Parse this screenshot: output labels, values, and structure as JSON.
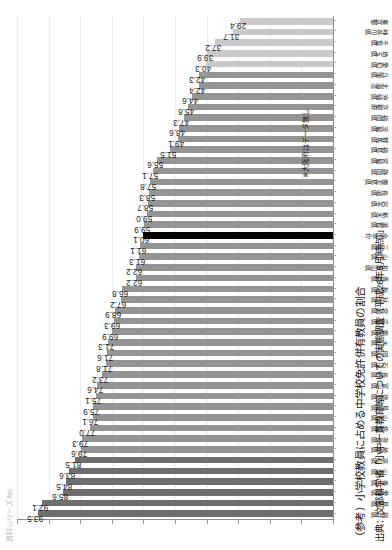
{
  "figure": {
    "title": "（参考）小学校教員に占める中学校免許併有教員の割合",
    "source": "出典：文部科学省「小中一貫教育等についての実態調査（平成26年5月時点）」",
    "data_note": "※大阪府はデータ無し",
    "top_note": "資料シリーズ No.",
    "accent_color": "#000000",
    "bar_color_dark": "#6e6e6e",
    "bar_color_mid": "#949494",
    "bar_color_light": "#c9c9c9"
  },
  "chart_data": {
    "type": "bar",
    "title": "（参考）小学校教員に占める中学校免許併有教員の割合",
    "xlabel": "",
    "ylabel": "",
    "ylim": [
      0,
      100
    ],
    "grid": true,
    "legend": "none",
    "orientation": "vertical-bars-rotated-90",
    "highlight_category": "全国平均",
    "highlight_value": 59.9,
    "categories": [
      "福井県",
      "島根県",
      "愛媛県",
      "香川県",
      "山梨県",
      "高知県",
      "岐阜県",
      "奈良県",
      "佐賀県",
      "山形県",
      "鳥取県",
      "徳島県",
      "富山県",
      "長野県",
      "石川県",
      "岡山県",
      "大分県",
      "熊本県",
      "広島県",
      "宮崎県",
      "秋田県",
      "新潟県",
      "青森県",
      "和歌山県",
      "山口県",
      "三重県",
      "全国平均",
      "滋賀県",
      "栃木県",
      "岩手県",
      "長崎県",
      "鹿児島県",
      "静岡県",
      "宮城県",
      "福島県",
      "群馬県",
      "茨城県",
      "福岡県",
      "京都府",
      "沖縄県",
      "北海道",
      "兵庫県",
      "愛知県",
      "埼玉県",
      "千葉県",
      "神奈川県",
      "東京都"
    ],
    "values": [
      93.5,
      92.1,
      85.6,
      84.5,
      83.6,
      81.5,
      79.6,
      79.3,
      77.0,
      76.1,
      75.9,
      75.1,
      74.6,
      73.2,
      71.8,
      71.6,
      71.3,
      69.9,
      69.3,
      68.9,
      67.2,
      66.8,
      62.2,
      62.2,
      61.3,
      61.1,
      60.1,
      59.9,
      59.0,
      58.7,
      58.3,
      57.8,
      57.1,
      55.6,
      51.5,
      49.1,
      48.6,
      47.3,
      45.8,
      44.6,
      42.4,
      42.3,
      40.3,
      39.9,
      37.2,
      31.7,
      29.4
    ],
    "yticks": [
      0,
      10,
      20,
      30,
      40,
      50,
      60,
      70,
      80,
      90,
      100
    ]
  }
}
